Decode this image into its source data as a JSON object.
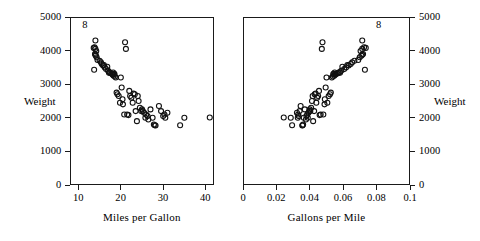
{
  "figure": {
    "annotation_label": "8",
    "weight_label": "Weight"
  },
  "chart_data": [
    {
      "type": "scatter",
      "panel": "left",
      "title": "",
      "xlabel": "Miles per Gallon",
      "ylabel": "Weight",
      "xlim": [
        8,
        42
      ],
      "ylim": [
        0,
        5000
      ],
      "xticks": [
        10,
        20,
        30,
        40
      ],
      "xticklabels": [
        "10",
        "20",
        "30",
        "40"
      ],
      "yticks": [
        0,
        1000,
        2000,
        3000,
        4000,
        5000
      ],
      "yticklabels": [
        "0",
        "1000",
        "2000",
        "3000",
        "4000",
        "5000"
      ],
      "grid": false,
      "legend": "none",
      "marker": "open-circle",
      "annotations": [
        {
          "text": "8",
          "x": 11.6,
          "y": 4760
        }
      ],
      "x": [
        13.8,
        14.0,
        14.2,
        13.9,
        14.1,
        14.3,
        14.0,
        13.7,
        14.5,
        15.0,
        15.3,
        15.5,
        16.0,
        16.2,
        16.5,
        17.0,
        17.3,
        17.5,
        17.8,
        18.0,
        18.1,
        18.2,
        18.3,
        18.5,
        18.6,
        18.8,
        19.0,
        19.2,
        19.5,
        20.0,
        20.2,
        20.5,
        21.0,
        21.2,
        21.5,
        22.0,
        22.2,
        22.5,
        23.0,
        23.3,
        23.5,
        24.0,
        24.2,
        24.5,
        25.0,
        25.2,
        25.5,
        26.0,
        26.3,
        26.5,
        27.0,
        27.5,
        28.0,
        28.2,
        29.0,
        29.5,
        30.0,
        30.3,
        30.5,
        31.0,
        34.0,
        35.0,
        41.0,
        14.0,
        15.8,
        16.8,
        19.8,
        20.8,
        21.8,
        22.8,
        24.8,
        13.6,
        17.2,
        18.4,
        20.4,
        23.8,
        25.8,
        27.8
      ],
      "y": [
        4100,
        4050,
        3990,
        3900,
        3850,
        3800,
        4300,
        3430,
        3720,
        3700,
        3650,
        3600,
        3570,
        3500,
        3450,
        3400,
        3360,
        3330,
        3320,
        3300,
        3280,
        3350,
        3250,
        3300,
        3230,
        3200,
        2750,
        2700,
        2650,
        3200,
        2900,
        2400,
        4250,
        4050,
        2100,
        2800,
        2650,
        2600,
        2720,
        2700,
        2200,
        2650,
        2500,
        2300,
        2250,
        2200,
        2150,
        2100,
        2050,
        1950,
        2250,
        2000,
        1780,
        1770,
        2350,
        2200,
        2050,
        2100,
        2000,
        2150,
        1780,
        2000,
        2010,
        3880,
        3560,
        3520,
        2450,
        2100,
        2080,
        2450,
        2200,
        4080,
        3340,
        3310,
        2550,
        1900,
        2000,
        1800
      ]
    },
    {
      "type": "scatter",
      "panel": "right",
      "title": "",
      "xlabel": "Gallons per Mile",
      "ylabel": "Weight",
      "xlim": [
        0,
        0.1
      ],
      "ylim": [
        0,
        5000
      ],
      "xticks": [
        0,
        0.02,
        0.04,
        0.06,
        0.08,
        0.1
      ],
      "xticklabels": [
        "0",
        "0.02",
        "0.04",
        "0.06",
        "0.08",
        "0.1"
      ],
      "yticks": [
        0,
        1000,
        2000,
        3000,
        4000,
        5000
      ],
      "yticklabels": [
        "0",
        "1000",
        "2000",
        "3000",
        "4000",
        "5000"
      ],
      "grid": false,
      "legend": "none",
      "marker": "open-circle",
      "annotations": [
        {
          "text": "8",
          "x": 0.0815,
          "y": 4760
        }
      ],
      "x": [
        0.0725,
        0.0714,
        0.0704,
        0.0719,
        0.0709,
        0.0699,
        0.0714,
        0.073,
        0.069,
        0.0667,
        0.0654,
        0.0645,
        0.0625,
        0.0617,
        0.0606,
        0.0588,
        0.0578,
        0.0571,
        0.0562,
        0.0556,
        0.0552,
        0.0549,
        0.0546,
        0.0541,
        0.0538,
        0.0532,
        0.0526,
        0.0521,
        0.0513,
        0.05,
        0.0495,
        0.0488,
        0.0476,
        0.0472,
        0.0465,
        0.0455,
        0.045,
        0.0444,
        0.0435,
        0.0429,
        0.0426,
        0.0417,
        0.0413,
        0.0408,
        0.04,
        0.0397,
        0.0392,
        0.0385,
        0.038,
        0.0377,
        0.037,
        0.0364,
        0.0357,
        0.0355,
        0.0345,
        0.0339,
        0.0333,
        0.033,
        0.0328,
        0.0323,
        0.0294,
        0.0286,
        0.0244,
        0.0714,
        0.0633,
        0.0595,
        0.0505,
        0.0481,
        0.0459,
        0.0439,
        0.0403,
        0.0735,
        0.0581,
        0.0543,
        0.049,
        0.042,
        0.0388,
        0.036
      ],
      "y": [
        4100,
        4050,
        3990,
        3900,
        3850,
        3800,
        4300,
        3430,
        3720,
        3700,
        3650,
        3600,
        3570,
        3500,
        3450,
        3400,
        3360,
        3330,
        3320,
        3300,
        3280,
        3350,
        3250,
        3300,
        3230,
        3200,
        2750,
        2700,
        2650,
        3200,
        2900,
        2400,
        4250,
        4050,
        2100,
        2800,
        2650,
        2600,
        2720,
        2700,
        2200,
        2650,
        2500,
        2300,
        2250,
        2200,
        2150,
        2100,
        2050,
        1950,
        2250,
        2000,
        1780,
        1770,
        2350,
        2200,
        2050,
        2100,
        2000,
        2150,
        1780,
        2000,
        2010,
        3880,
        3560,
        3520,
        2450,
        2100,
        2080,
        2450,
        2200,
        4080,
        3340,
        3310,
        2550,
        1900,
        2000,
        1800
      ]
    }
  ]
}
